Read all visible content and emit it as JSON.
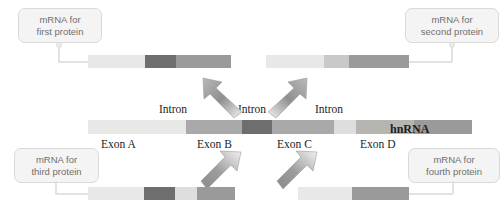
{
  "diagram": {
    "hnrna_label": "hnRNA"
  },
  "colors": {
    "exon_light": "#e8e8e6",
    "exon_mid_light": "#d9d9d6",
    "exon_dark": "#6e6e6e",
    "exon_mid_dark": "#9a9a9a",
    "intron_gray": "#a9a9a9",
    "intron_gray_light": "#b5b5b2",
    "callout_bg": "#f4f4f4",
    "callout_border": "#d9d9d9",
    "callout_text": "#6f6f6f",
    "label_text": "#1d1d1d",
    "arrow_fill": "#a0a0a0",
    "leader_line": "#e2e2e2"
  },
  "callouts": {
    "first": {
      "line1": "mRNA for",
      "line2": "first protein"
    },
    "second": {
      "line1": "mRNA for",
      "line2": "second protein"
    },
    "third": {
      "line1": "mRNA for",
      "line2": "third protein"
    },
    "fourth": {
      "line1": "mRNA for",
      "line2": "fourth protein"
    }
  },
  "hnrna": {
    "label": "hnRNA",
    "intron_labels": [
      "Intron",
      "Intron",
      "Intron"
    ],
    "exon_labels": [
      "Exon A",
      "Exon B",
      "Exon C",
      "Exon D"
    ],
    "segments": [
      {
        "name": "Exon A",
        "kind": "exon",
        "width": 98,
        "color": "#e8e8e6"
      },
      {
        "name": "Intron 1",
        "kind": "intron",
        "width": 56,
        "color": "#a9a9a9"
      },
      {
        "name": "Exon B",
        "kind": "exon",
        "width": 30,
        "color": "#6e6e6e"
      },
      {
        "name": "Intron 2",
        "kind": "intron",
        "width": 62,
        "color": "#a9a9a9"
      },
      {
        "name": "Exon C",
        "kind": "exon",
        "width": 22,
        "color": "#dedede"
      },
      {
        "name": "Intron 3",
        "kind": "intron",
        "width": 58,
        "color": "#b5b5b2"
      },
      {
        "name": "Exon D",
        "kind": "exon",
        "width": 58,
        "color": "#9a9a9a"
      }
    ]
  },
  "mrnas": {
    "first": {
      "name": "mRNA for first protein",
      "segments": [
        {
          "name": "Exon A",
          "width": 57,
          "color": "#e8e8e6"
        },
        {
          "name": "Exon B",
          "width": 31,
          "color": "#6e6e6e"
        },
        {
          "name": "Exon D",
          "width": 55,
          "color": "#9a9a9a"
        }
      ]
    },
    "second": {
      "name": "mRNA for second protein",
      "segments": [
        {
          "name": "Exon A",
          "width": 58,
          "color": "#e8e8e6"
        },
        {
          "name": "Exon C",
          "width": 25,
          "color": "#c9c9c7"
        },
        {
          "name": "Exon D",
          "width": 60,
          "color": "#9a9a9a"
        }
      ]
    },
    "third": {
      "name": "mRNA for third protein",
      "segments": [
        {
          "name": "Exon A",
          "width": 56,
          "color": "#e8e8e6"
        },
        {
          "name": "Exon B",
          "width": 31,
          "color": "#6e6e6e"
        },
        {
          "name": "Exon C",
          "width": 22,
          "color": "#dedede"
        },
        {
          "name": "Exon D",
          "width": 38,
          "color": "#9a9a9a"
        }
      ]
    },
    "fourth": {
      "name": "mRNA for fourth protein",
      "segments": [
        {
          "name": "Exon A",
          "width": 54,
          "color": "#e8e8e6"
        },
        {
          "name": "Exon D",
          "width": 57,
          "color": "#9a9a9a"
        }
      ]
    }
  },
  "arrows": [
    {
      "name": "splice-arrow-to-first",
      "direction": "up-left"
    },
    {
      "name": "splice-arrow-to-second",
      "direction": "up-right"
    },
    {
      "name": "splice-arrow-to-third",
      "direction": "down-right"
    },
    {
      "name": "splice-arrow-to-fourth",
      "direction": "down-right"
    }
  ]
}
